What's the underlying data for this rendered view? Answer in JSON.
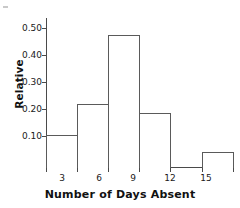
{
  "chart_data": {
    "type": "bar",
    "title": "",
    "subtitle": "",
    "xlabel": "Number of Days Absent",
    "ylabel": "Relative",
    "categories": [
      "3",
      "6",
      "9",
      "12",
      "15"
    ],
    "values": [
      0.125,
      0.24,
      0.495,
      0.205,
      0.06
    ],
    "bin_edges": [
      1.5,
      4.5,
      7.5,
      10.5,
      13.5,
      16.5
    ],
    "xtick_labels": [
      "3",
      "6",
      "9",
      "12",
      "15"
    ],
    "ytick_labels": [
      "0.10",
      "0.20",
      "0.30",
      "0.40",
      "0.50"
    ],
    "ytick_values": [
      0.1,
      0.2,
      0.3,
      0.4,
      0.5
    ],
    "ylim": [
      0,
      0.56
    ],
    "xlim": [
      1.5,
      16.5
    ],
    "grid": false,
    "legend": null,
    "bar_edge_color": "#5a5a5a",
    "bar_fill_color": "#ffffff",
    "axis_color": "#4a4a4a",
    "text_color": "#1a1a1a"
  },
  "axes": {
    "y_title": "Relative",
    "x_title": "Number of Days Absent"
  },
  "ticks": {
    "y": [
      {
        "label": "0.50",
        "value": 0.5
      },
      {
        "label": "0.40",
        "value": 0.4
      },
      {
        "label": "0.30",
        "value": 0.3
      },
      {
        "label": "0.20",
        "value": 0.2
      },
      {
        "label": "0.10",
        "value": 0.1
      }
    ],
    "x": [
      {
        "label": "3"
      },
      {
        "label": "6"
      },
      {
        "label": "9"
      },
      {
        "label": "12"
      },
      {
        "label": "15"
      }
    ]
  },
  "bars": [
    {
      "label": "3",
      "value": 0.125
    },
    {
      "label": "6",
      "value": 0.24
    },
    {
      "label": "9",
      "value": 0.495
    },
    {
      "label": "12",
      "value": 0.205
    },
    {
      "label": "15",
      "value": 0.06
    }
  ]
}
